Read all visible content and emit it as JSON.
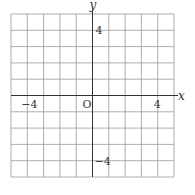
{
  "chart_data": {
    "type": "grid",
    "title": "",
    "xlabel": "x",
    "ylabel": "y",
    "xlim": [
      -5,
      5
    ],
    "ylim": [
      -5,
      5
    ],
    "grid": true,
    "grid_step": 1,
    "origin_label": "O",
    "x_tick_labels": [
      {
        "value": -4,
        "label": "−4"
      },
      {
        "value": 4,
        "label": "4"
      }
    ],
    "y_tick_labels": [
      {
        "value": 4,
        "label": "4"
      },
      {
        "value": -4,
        "label": "−4"
      }
    ]
  }
}
